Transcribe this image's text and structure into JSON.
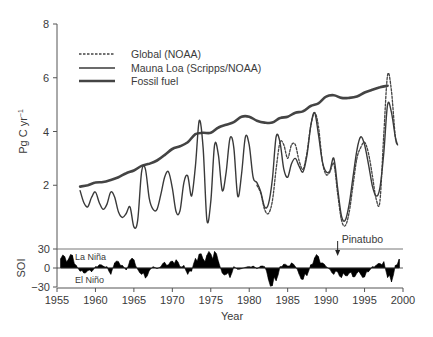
{
  "chart_data": [
    {
      "type": "line",
      "title": "",
      "xlabel": "Year",
      "ylabel": "Pg C yr⁻¹",
      "ylabel_parts": {
        "base": "Pg C yr",
        "sup": "−1"
      },
      "xlim": [
        1955,
        2000
      ],
      "ylim": [
        0,
        8
      ],
      "x_ticks": [
        1955,
        1960,
        1965,
        1970,
        1975,
        1980,
        1985,
        1990,
        1995,
        2000
      ],
      "x_tick_labels": [
        "1955",
        "1960",
        "1965",
        "1970",
        "1975",
        "1980",
        "1985",
        "1990",
        "1995",
        "2000"
      ],
      "y_ticks": [
        2,
        4,
        6,
        8
      ],
      "y_tick_labels": [
        "2",
        "4",
        "6",
        "8"
      ],
      "grid": false,
      "legend_position": "top-left",
      "series": [
        {
          "name": "Global (NOAA)",
          "style": "dashed",
          "color": "#444444",
          "x": [
            1981.0,
            1981.5,
            1982.0,
            1982.5,
            1983.0,
            1983.5,
            1984.0,
            1984.5,
            1985.0,
            1985.5,
            1986.0,
            1986.5,
            1987.0,
            1987.5,
            1988.0,
            1988.5,
            1989.0,
            1989.5,
            1990.0,
            1990.5,
            1991.0,
            1991.5,
            1992.0,
            1992.5,
            1993.0,
            1993.5,
            1994.0,
            1994.5,
            1995.0,
            1995.5,
            1996.0,
            1996.5,
            1997.0,
            1997.5,
            1998.0,
            1998.5,
            1999.0,
            1999.3
          ],
          "values": [
            2.0,
            1.7,
            1.1,
            0.95,
            1.4,
            2.6,
            3.6,
            3.5,
            3.0,
            3.5,
            3.5,
            2.9,
            2.6,
            3.2,
            4.2,
            4.7,
            4.2,
            2.9,
            2.4,
            2.5,
            2.8,
            1.7,
            0.7,
            0.5,
            1.0,
            2.0,
            3.0,
            3.4,
            3.6,
            3.2,
            2.4,
            1.5,
            1.4,
            3.9,
            6.1,
            5.5,
            3.8,
            3.5
          ]
        },
        {
          "name": "Mauna Loa (Scripps/NOAA)",
          "style": "solid",
          "color": "#3a3a3a",
          "x": [
            1958.0,
            1958.5,
            1959.0,
            1959.5,
            1960.0,
            1960.5,
            1961.0,
            1961.5,
            1962.0,
            1962.5,
            1963.0,
            1963.5,
            1964.0,
            1964.5,
            1965.0,
            1965.5,
            1966.0,
            1966.5,
            1967.0,
            1967.5,
            1968.0,
            1968.5,
            1969.0,
            1969.5,
            1970.0,
            1970.5,
            1971.0,
            1971.5,
            1972.0,
            1972.5,
            1973.0,
            1973.5,
            1974.0,
            1974.5,
            1975.0,
            1975.5,
            1976.0,
            1976.5,
            1977.0,
            1977.5,
            1978.0,
            1978.5,
            1979.0,
            1979.5,
            1980.0,
            1980.5,
            1981.0,
            1981.5,
            1982.0,
            1982.5,
            1983.0,
            1983.5,
            1984.0,
            1984.5,
            1985.0,
            1985.5,
            1986.0,
            1986.5,
            1987.0,
            1987.5,
            1988.0,
            1988.5,
            1989.0,
            1989.5,
            1990.0,
            1990.5,
            1991.0,
            1991.5,
            1992.0,
            1992.5,
            1993.0,
            1993.5,
            1994.0,
            1994.5,
            1995.0,
            1995.5,
            1996.0,
            1996.5,
            1997.0,
            1997.5,
            1998.0,
            1998.5,
            1999.0,
            1999.3
          ],
          "values": [
            1.8,
            1.35,
            1.2,
            1.55,
            1.75,
            1.35,
            1.1,
            1.3,
            1.75,
            1.55,
            1.0,
            0.8,
            0.95,
            1.2,
            0.45,
            0.7,
            2.5,
            2.6,
            1.5,
            1.1,
            1.1,
            1.65,
            2.3,
            2.5,
            1.9,
            1.0,
            1.05,
            2.1,
            2.35,
            1.6,
            2.7,
            4.4,
            3.4,
            0.7,
            1.4,
            3.5,
            3.1,
            1.8,
            2.5,
            3.75,
            3.4,
            1.6,
            2.4,
            3.8,
            3.5,
            2.3,
            2.1,
            1.75,
            1.2,
            1.3,
            2.2,
            3.8,
            3.6,
            2.6,
            2.3,
            2.8,
            3.0,
            2.7,
            2.5,
            3.1,
            4.2,
            4.7,
            3.9,
            2.9,
            2.5,
            2.55,
            3.0,
            1.9,
            0.85,
            0.7,
            1.3,
            2.3,
            3.3,
            3.8,
            3.5,
            2.8,
            2.0,
            1.6,
            1.9,
            3.2,
            5.0,
            4.7,
            3.8,
            3.5
          ]
        },
        {
          "name": "Fossil fuel",
          "style": "thick",
          "color": "#444444",
          "x": [
            1958,
            1959,
            1960,
            1961,
            1962,
            1963,
            1964,
            1965,
            1966,
            1967,
            1968,
            1969,
            1970,
            1971,
            1972,
            1973,
            1974,
            1975,
            1976,
            1977,
            1978,
            1979,
            1980,
            1981,
            1982,
            1983,
            1984,
            1985,
            1986,
            1987,
            1988,
            1989,
            1990,
            1991,
            1992,
            1993,
            1994,
            1995,
            1996,
            1997,
            1998
          ],
          "values": [
            1.95,
            2.0,
            2.1,
            2.12,
            2.2,
            2.3,
            2.45,
            2.55,
            2.72,
            2.8,
            2.92,
            3.12,
            3.35,
            3.45,
            3.6,
            3.9,
            3.95,
            3.95,
            4.15,
            4.25,
            4.35,
            4.55,
            4.55,
            4.4,
            4.33,
            4.33,
            4.5,
            4.55,
            4.7,
            4.75,
            4.95,
            5.05,
            5.3,
            5.35,
            5.25,
            5.25,
            5.3,
            5.45,
            5.55,
            5.65,
            5.7
          ]
        }
      ],
      "annotations": [
        {
          "text": "Pinatubo",
          "x": 1991.5,
          "arrow": "down"
        }
      ]
    },
    {
      "type": "area",
      "title": "",
      "xlabel": "Year",
      "ylabel": "SOI",
      "xlim": [
        1955,
        2000
      ],
      "ylim": [
        -30,
        30
      ],
      "y_ticks": [
        30,
        0,
        -30
      ],
      "y_tick_labels": [
        "30",
        "0",
        "−30"
      ],
      "grid": false,
      "series": [
        {
          "name": "SOI",
          "color": "#000000",
          "x": [
            1955.5,
            1956,
            1956.5,
            1957,
            1957.5,
            1958,
            1958.5,
            1959,
            1959.5,
            1960,
            1960.5,
            1961,
            1961.5,
            1962,
            1962.5,
            1963,
            1963.5,
            1964,
            1964.5,
            1965,
            1965.5,
            1966,
            1966.5,
            1967,
            1967.5,
            1968,
            1968.5,
            1969,
            1969.5,
            1970,
            1970.5,
            1971,
            1971.5,
            1972,
            1972.5,
            1973,
            1973.5,
            1974,
            1974.5,
            1975,
            1975.5,
            1976,
            1976.5,
            1977,
            1977.5,
            1978,
            1978.5,
            1979,
            1979.5,
            1980,
            1980.5,
            1981,
            1981.5,
            1982,
            1982.5,
            1983,
            1983.5,
            1984,
            1984.5,
            1985,
            1985.5,
            1986,
            1986.5,
            1987,
            1987.5,
            1988,
            1988.5,
            1989,
            1989.5,
            1990,
            1990.5,
            1991,
            1991.5,
            1992,
            1992.5,
            1993,
            1993.5,
            1994,
            1994.5,
            1995,
            1995.5,
            1996,
            1996.5,
            1997,
            1997.5,
            1998,
            1998.5,
            1999,
            1999.5
          ],
          "values": [
            15,
            18,
            14,
            20,
            4,
            -5,
            -8,
            -4,
            -6,
            2,
            5,
            3,
            2,
            -10,
            8,
            10,
            4,
            -3,
            12,
            13,
            -2,
            -10,
            -16,
            -4,
            2,
            -1,
            2,
            9,
            5,
            11,
            13,
            2,
            4,
            -10,
            -5,
            15,
            22,
            14,
            20,
            22,
            26,
            10,
            -8,
            -10,
            -15,
            2,
            -2,
            -1,
            1,
            2,
            3,
            -1,
            3,
            2,
            -18,
            -28,
            -20,
            2,
            6,
            3,
            8,
            2,
            -10,
            -18,
            -12,
            5,
            16,
            18,
            8,
            2,
            -2,
            -10,
            -6,
            -15,
            -12,
            -8,
            -14,
            -8,
            -10,
            -14,
            -6,
            2,
            4,
            7,
            10,
            -15,
            -22,
            4,
            14,
            18
          ]
        }
      ],
      "annotations": [
        {
          "text": "La Niña",
          "position": "upper-left"
        },
        {
          "text": "El Niño",
          "position": "lower-left"
        }
      ]
    }
  ]
}
